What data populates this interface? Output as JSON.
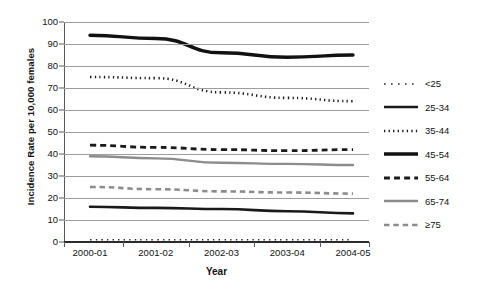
{
  "chart_data": {
    "type": "line",
    "title": "",
    "xlabel": "Year",
    "ylabel": "Incidence Rate per 10,000 females",
    "categories": [
      "2000-01",
      "2001-02",
      "2002-03",
      "2003-04",
      "2004-05"
    ],
    "ylim": [
      0,
      100
    ],
    "ytick_step": 10,
    "yticks": [
      "100",
      "90",
      "80",
      "70",
      "60",
      "50",
      "40",
      "30",
      "20",
      "10",
      "0"
    ],
    "grid": true,
    "legend_position": "right",
    "series": [
      {
        "name": "<25",
        "values": [
          1,
          1,
          1,
          1,
          1
        ],
        "style": "fine-dotted",
        "color": "#2b2b2b",
        "width": 1.6
      },
      {
        "name": "25-34",
        "values": [
          16,
          15.5,
          15,
          14,
          13
        ],
        "style": "solid",
        "color": "#1a1a1a",
        "width": 2.6
      },
      {
        "name": "35-44",
        "values": [
          75,
          74.5,
          68,
          65.5,
          64
        ],
        "style": "dotted",
        "color": "#1a1a1a",
        "width": 2.6
      },
      {
        "name": "45-54",
        "values": [
          94,
          92.5,
          86,
          84,
          85
        ],
        "style": "solid",
        "color": "#111111",
        "width": 3.4
      },
      {
        "name": "55-64",
        "values": [
          44,
          43,
          42,
          41.5,
          42
        ],
        "style": "dashed",
        "color": "#1a1a1a",
        "width": 2.8
      },
      {
        "name": "65-74",
        "values": [
          39,
          38,
          36,
          35.5,
          35
        ],
        "style": "solid",
        "color": "#8c8c8c",
        "width": 2.4
      },
      {
        "name": ">=75",
        "values": [
          25,
          24,
          23,
          22.5,
          22
        ],
        "style": "dashed",
        "color": "#8c8c8c",
        "width": 2.6
      }
    ]
  },
  "legend": {
    "items": [
      {
        "label": "<25"
      },
      {
        "label": "25-34"
      },
      {
        "label": "35-44"
      },
      {
        "label": "45-54"
      },
      {
        "label": "55-64"
      },
      {
        "label": "65-74"
      },
      {
        "label": "≥75"
      }
    ]
  },
  "colors": {
    "black": "#1a1a1a",
    "gray": "#8c8c8c",
    "gridline": "#9d9d9d",
    "background": "#ffffff"
  }
}
